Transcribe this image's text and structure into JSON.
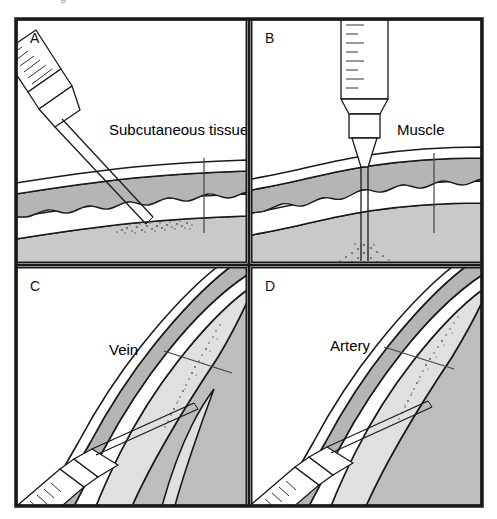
{
  "figure": {
    "clipped_caption_text": "g",
    "width": 497,
    "height": 519,
    "background_color": "#ffffff",
    "frame_color": "#1a1a1a",
    "panels": [
      {
        "letter": "A",
        "name": "subcutaneous-injection",
        "label": "Subcutaneous tissue",
        "syringe": "angled-from-upper-left",
        "needle_angle_description": "oblique, approximately 45 degrees",
        "deposit_target": "subcutaneous layer"
      },
      {
        "letter": "B",
        "name": "intramuscular-injection",
        "label": "Muscle",
        "syringe": "vertical-from-top",
        "needle_angle_description": "perpendicular, 90 degrees",
        "deposit_target": "muscle layer"
      },
      {
        "letter": "C",
        "name": "intravenous-injection",
        "label": "Vein",
        "syringe": "shallow-from-lower-left",
        "needle_angle_description": "shallow, nearly parallel to skin",
        "deposit_target": "vein lumen"
      },
      {
        "letter": "D",
        "name": "intraarterial-injection",
        "label": "Artery",
        "syringe": "shallow-from-lower-left",
        "needle_angle_description": "shallow, nearly parallel to skin",
        "deposit_target": "artery lumen"
      }
    ],
    "colors": {
      "epidermis_fill": "#ffffff",
      "dermis_fill": "#b5b5b5",
      "subcutaneous_fill": "#ffffff",
      "muscle_fill": "#c9c9c9",
      "vessel_wall_fill": "#b5b5b5",
      "vessel_lumen_fill": "#ffffff",
      "deep_tissue_fill": "#bdbdbd",
      "outline": "#1a1a1a",
      "syringe_fill": "#ffffff",
      "label_text": "#000000",
      "leader_line": "#444444"
    }
  }
}
